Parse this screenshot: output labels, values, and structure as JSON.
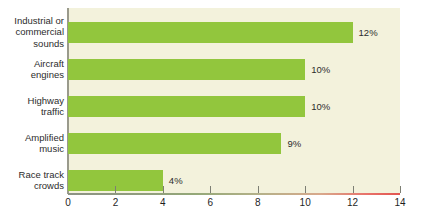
{
  "chart_data": {
    "type": "bar",
    "orientation": "horizontal",
    "title": "",
    "subtitle": "",
    "xlabel": "",
    "ylabel": "",
    "categories": [
      "Industrial or commercial sounds",
      "Aircraft engines",
      "Highway traffic",
      "Amplified music",
      "Race track crowds"
    ],
    "category_lines": [
      [
        "Industrial or",
        "commercial",
        "sounds"
      ],
      [
        "Aircraft",
        "engines"
      ],
      [
        "Highway",
        "traffic"
      ],
      [
        "Amplified",
        "music"
      ],
      [
        "Race track",
        "crowds"
      ]
    ],
    "values": [
      12,
      10,
      10,
      9,
      4
    ],
    "value_labels": [
      "12%",
      "10%",
      "10%",
      "9%",
      "4%"
    ],
    "xlim": [
      0,
      14
    ],
    "xticks": [
      0,
      2,
      4,
      6,
      8,
      10,
      12,
      14
    ],
    "xtick_labels": [
      "0",
      "2",
      "4",
      "6",
      "8",
      "10",
      "12",
      "14"
    ],
    "grid": false,
    "legend": null,
    "annotations": [],
    "colors": {
      "bar": "#92c63d",
      "plot_background": "#f3f2dc",
      "page_background": "#ffffff",
      "text": "#2c2c2c",
      "axis_left": "#8c9384",
      "axis_right": "#e2554f",
      "tick": "#7d7f74"
    }
  }
}
